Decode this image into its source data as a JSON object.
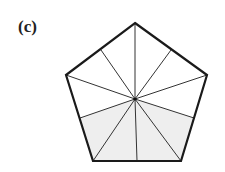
{
  "figure": {
    "label": "(c)",
    "shape": "regular pentagon",
    "divisions": 10,
    "shaded_divisions": 5,
    "shaded_fraction": "5/10",
    "colors": {
      "stroke": "#1a1a1a",
      "shade": "#eeeeee",
      "background": "#ffffff"
    }
  }
}
